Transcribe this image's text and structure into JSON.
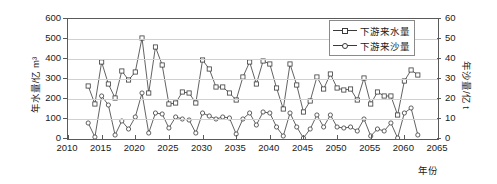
{
  "chart_data": {
    "type": "line",
    "title": "",
    "xlabel": "年份",
    "ylabel": "年水量/亿 m³",
    "ylabel_right": "年沙量/亿 t",
    "xlim": [
      2010,
      2065
    ],
    "ylim": [
      0,
      600
    ],
    "ylim_right": [
      0,
      60
    ],
    "xticks": [
      "2010",
      "2015",
      "2020",
      "2025",
      "2030",
      "2035",
      "2040",
      "2045",
      "2050",
      "2055",
      "2060",
      "2065"
    ],
    "yticks_left": [
      "0",
      "100",
      "200",
      "300",
      "400",
      "500",
      "600"
    ],
    "yticks_right": [
      "0",
      "10",
      "20",
      "30",
      "40",
      "50",
      "60"
    ],
    "grid": true,
    "legend_position": "top-right",
    "x": [
      2013,
      2014,
      2015,
      2016,
      2017,
      2018,
      2019,
      2020,
      2021,
      2022,
      2023,
      2024,
      2025,
      2026,
      2027,
      2028,
      2029,
      2030,
      2031,
      2032,
      2033,
      2034,
      2035,
      2036,
      2037,
      2038,
      2039,
      2040,
      2041,
      2042,
      2043,
      2044,
      2045,
      2046,
      2047,
      2048,
      2049,
      2050,
      2051,
      2052,
      2053,
      2054,
      2055,
      2056,
      2057,
      2058,
      2059,
      2060,
      2061,
      2062
    ],
    "series": [
      {
        "name": "下游来水量",
        "marker": "square",
        "axis": "left",
        "unit": "亿 m³",
        "values": [
          265,
          175,
          385,
          275,
          205,
          340,
          295,
          335,
          505,
          230,
          460,
          370,
          175,
          180,
          235,
          230,
          180,
          395,
          350,
          260,
          260,
          230,
          195,
          310,
          385,
          275,
          390,
          375,
          255,
          150,
          375,
          270,
          135,
          190,
          310,
          250,
          325,
          255,
          245,
          250,
          195,
          305,
          175,
          235,
          215,
          215,
          120,
          290,
          345,
          320
        ]
      },
      {
        "name": "下游来沙量",
        "marker": "circle",
        "axis": "right",
        "unit": "亿 t",
        "values": [
          8,
          1,
          21.5,
          17,
          2,
          9,
          5,
          11,
          23,
          3,
          13,
          12.5,
          5.5,
          11,
          10,
          9.5,
          3,
          13,
          11.5,
          10,
          11,
          10.5,
          2.5,
          10,
          13,
          7,
          13.5,
          13,
          6,
          1.5,
          13,
          6,
          0.5,
          5,
          12,
          6,
          12,
          6,
          5.5,
          6,
          4,
          10,
          1.5,
          5,
          4,
          8,
          0.5,
          13,
          15.5,
          2
        ]
      }
    ]
  },
  "legend": {
    "items": [
      {
        "label": "下游来水量",
        "marker": "square"
      },
      {
        "label": "下游来沙量",
        "marker": "circle"
      }
    ]
  },
  "colors": {
    "line": "#3a3a3a",
    "marker_fill": "#ffffff",
    "marker_stroke": "#3a3a3a",
    "grid": "#d0d0d0",
    "axis": "#5a5a5a",
    "text": "#1a1a1a"
  }
}
